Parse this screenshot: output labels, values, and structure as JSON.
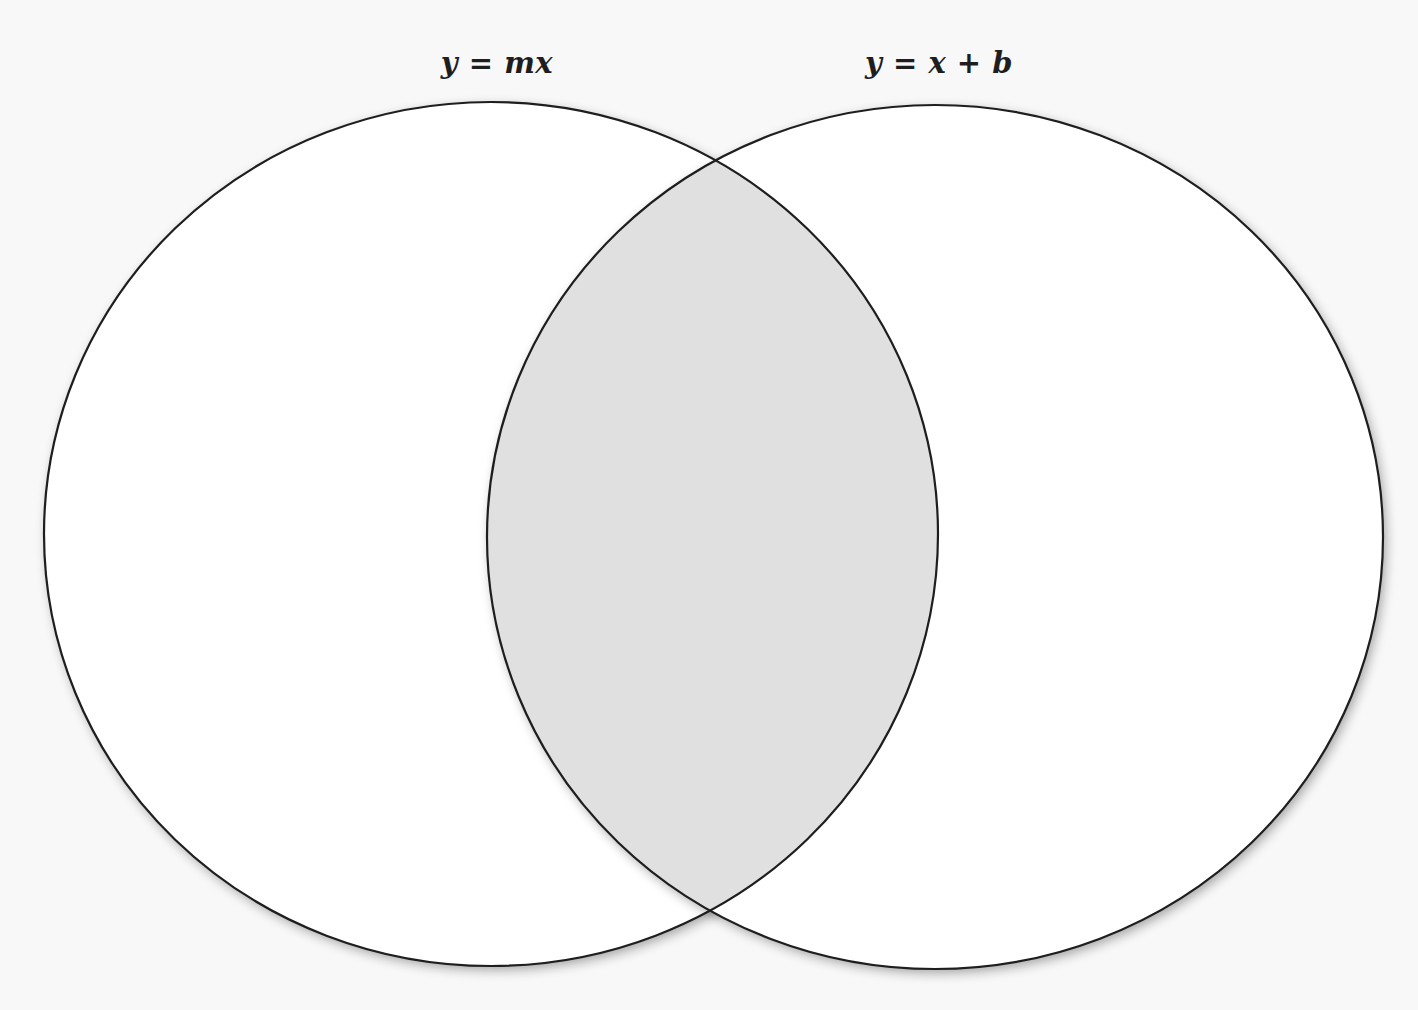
{
  "diagram": {
    "type": "venn",
    "sets": [
      {
        "id": "left",
        "label": "y = mx",
        "label_pos": {
          "x": 497,
          "y": 46
        },
        "ellipse": {
          "cx": 491,
          "cy": 534,
          "rx": 447,
          "ry": 432
        },
        "fill": "#ffffff"
      },
      {
        "id": "right",
        "label": "y = x + b",
        "label_pos": {
          "x": 939,
          "y": 46
        },
        "ellipse": {
          "cx": 935,
          "cy": 537,
          "rx": 448,
          "ry": 432
        },
        "fill": "#ffffff"
      }
    ],
    "intersection": {
      "fill": "#e0e0e0",
      "label": ""
    },
    "colors": {
      "background": "#f8f8f8",
      "stroke": "#1e1e1e",
      "shadow": "#9a9a9a",
      "intersection": "#e0e0e0"
    }
  }
}
